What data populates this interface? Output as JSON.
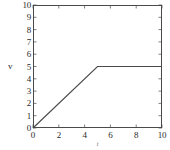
{
  "chart_data": {
    "type": "line",
    "title": "",
    "xlabel": "t",
    "ylabel": "v",
    "xlim": [
      0,
      10
    ],
    "ylim": [
      0,
      10
    ],
    "xticks": [
      0,
      2,
      4,
      6,
      8,
      10
    ],
    "yticks": [
      0,
      1,
      2,
      3,
      4,
      5,
      6,
      7,
      8,
      9,
      10
    ],
    "xtick_labels": [
      "0",
      "2",
      "4",
      "6",
      "8",
      "10"
    ],
    "ytick_labels": [
      "0",
      "1",
      "2",
      "3",
      "4",
      "5",
      "6",
      "7",
      "8",
      "9",
      "10"
    ],
    "grid": false,
    "legend": null,
    "series": [
      {
        "name": "v(t)",
        "color": "#4a4a4a",
        "x": [
          0,
          5,
          10
        ],
        "y": [
          0,
          5,
          5
        ]
      }
    ],
    "annotations": []
  },
  "axes": {
    "frame_color": "#4a4a4a",
    "tick_direction": "in",
    "background": "#ffffff"
  }
}
